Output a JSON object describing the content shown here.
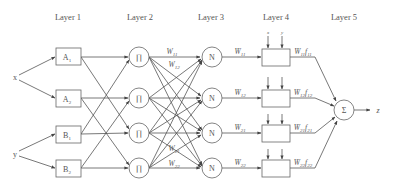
{
  "diagram": {
    "type": "ANFIS network architecture",
    "layers": [
      {
        "label": "Layer 1"
      },
      {
        "label": "Layer 2"
      },
      {
        "label": "Layer 3"
      },
      {
        "label": "Layer 4"
      },
      {
        "label": "Layer 5"
      }
    ],
    "inputs": [
      {
        "label": "x"
      },
      {
        "label": "y"
      }
    ],
    "layer1_nodes": [
      {
        "label": "A",
        "sub": "1"
      },
      {
        "label": "A",
        "sub": "2"
      },
      {
        "label": "B",
        "sub": "1"
      },
      {
        "label": "B",
        "sub": "2"
      }
    ],
    "layer2_nodes": [
      {
        "label": "∏"
      },
      {
        "label": "∏"
      },
      {
        "label": "∏"
      },
      {
        "label": "∏"
      }
    ],
    "layer2_weights": [
      {
        "label": "W",
        "sub": "11"
      },
      {
        "label": "W",
        "sub": "12"
      },
      {
        "label": "W",
        "sub": "21"
      },
      {
        "label": "W",
        "sub": "22"
      }
    ],
    "layer3_nodes": [
      {
        "label": "N"
      },
      {
        "label": "N"
      },
      {
        "label": "N"
      },
      {
        "label": "N"
      }
    ],
    "layer3_outputs": [
      {
        "label": "W̄",
        "sub": "11"
      },
      {
        "label": "W̄",
        "sub": "12"
      },
      {
        "label": "W̄",
        "sub": "21"
      },
      {
        "label": "W̄",
        "sub": "22"
      }
    ],
    "layer4_inputs": {
      "x": "x",
      "y": "y"
    },
    "layer4_outputs": [
      {
        "label": "W̄",
        "sub": "11",
        "f": "f",
        "fsub": "11"
      },
      {
        "label": "W̄",
        "sub": "12",
        "f": "f",
        "fsub": "12"
      },
      {
        "label": "W̄",
        "sub": "21",
        "f": "f",
        "fsub": "21"
      },
      {
        "label": "W̄",
        "sub": "22",
        "f": "f",
        "fsub": "22"
      }
    ],
    "layer5_node": {
      "label": "Σ"
    },
    "output": {
      "label": "z"
    }
  }
}
